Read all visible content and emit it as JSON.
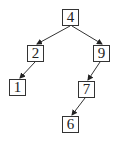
{
  "diagram": {
    "type": "binary-search-tree",
    "colors": {
      "stroke": "#333333",
      "text": "#222222",
      "background": "#ffffff"
    },
    "nodes": [
      {
        "id": "n4",
        "label": "4",
        "x": 62,
        "y": 9
      },
      {
        "id": "n2",
        "label": "2",
        "x": 27,
        "y": 45
      },
      {
        "id": "n9",
        "label": "9",
        "x": 93,
        "y": 45
      },
      {
        "id": "n1",
        "label": "1",
        "x": 9,
        "y": 79
      },
      {
        "id": "n7",
        "label": "7",
        "x": 78,
        "y": 81
      },
      {
        "id": "n6",
        "label": "6",
        "x": 62,
        "y": 116
      }
    ],
    "edges": [
      {
        "from": "4",
        "to": "2",
        "x1": 70,
        "y1": 26,
        "x2": 37,
        "y2": 44
      },
      {
        "from": "4",
        "to": "9",
        "x1": 72,
        "y1": 26,
        "x2": 102,
        "y2": 44
      },
      {
        "from": "2",
        "to": "1",
        "x1": 35,
        "y1": 62,
        "x2": 20,
        "y2": 78
      },
      {
        "from": "9",
        "to": "7",
        "x1": 100,
        "y1": 62,
        "x2": 88,
        "y2": 80
      },
      {
        "from": "7",
        "to": "6",
        "x1": 85,
        "y1": 98,
        "x2": 72,
        "y2": 115
      }
    ]
  }
}
